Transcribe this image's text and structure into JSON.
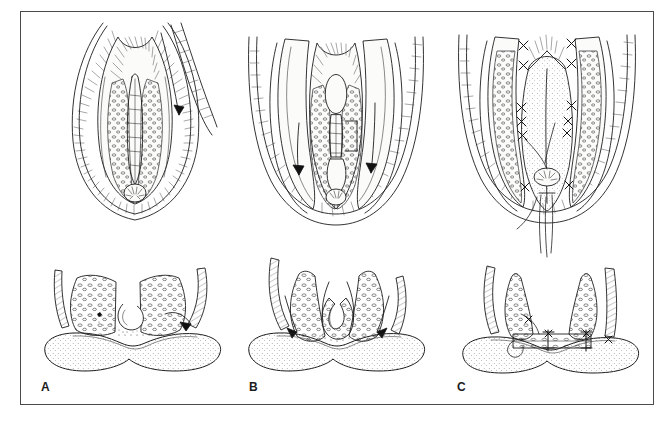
{
  "figure": {
    "kind": "medical-surgical-line-illustration",
    "style": "black-and-white pen-and-ink stipple/hatch line drawing",
    "background_color": "#ffffff",
    "ink_color": "#1d1d1d",
    "frame": {
      "present": true,
      "border_color": "#4a4a4a",
      "border_width_px": 1,
      "x": 20,
      "y": 11,
      "width": 634,
      "height": 394
    },
    "rows": [
      {
        "name": "superior-oral-view",
        "description": "Intraoral view of the palate from below/above showing the cleft, flaps and sutures"
      },
      {
        "name": "coronal-cross-section",
        "description": "Coronal section through the palate showing mucoperiosteal flaps, nasal mucosa and tongue"
      }
    ],
    "panels": [
      {
        "id": "A",
        "label": "A",
        "label_x": 40,
        "label_y": 385,
        "stage": "Markings and incisions — unrepaired cleft exposed",
        "top_view": {
          "description": "Oral view of a wide cleft of the secondary palate with lateral relaxing incision marked; uvula split, stippled palatal mucosa, hatched lip/cheek retraction",
          "features": [
            "cleft-margin",
            "lateral-relaxing-incision",
            "uvula",
            "hatched-mucosa",
            "retractor-edge",
            "incision-arrow"
          ]
        },
        "bottom_view": {
          "description": "Coronal section: two unelevated mucoperiosteal palatal shelves with stippled bone, nasal mucosa hook at the cleft edge, tongue below; arrow indicates incision direction",
          "features": [
            "palatal-shelf-left",
            "palatal-shelf-right",
            "nasal-mucosa-hook",
            "tongue",
            "alveolar-strip-left",
            "alveolar-strip-right",
            "incision-arrow"
          ]
        }
      },
      {
        "id": "B",
        "label": "B",
        "label_x": 248,
        "label_y": 385,
        "stage": "Flap elevation and medial mobilization",
        "top_view": {
          "description": "Oral view after lateral relaxing incisions; bipedicled mucoperiosteal flaps elevated and rotated medially, raw lateral gutters visible, arrows show medial advancement",
          "features": [
            "elevated-flap-left",
            "elevated-flap-right",
            "lateral-relaxing-gutter",
            "cleft-margin",
            "medial-advancement-arrow-left",
            "medial-advancement-arrow-right"
          ]
        },
        "bottom_view": {
          "description": "Coronal section: flaps lifted off bone and swung medially, nasal-mucosa hook dissected free, arrows show rotation toward the midline",
          "features": [
            "mobilized-flap-left",
            "mobilized-flap-right",
            "nasal-mucosa-hook",
            "tongue",
            "rotation-arrow-left",
            "rotation-arrow-right"
          ]
        }
      },
      {
        "id": "C",
        "label": "C",
        "label_x": 450,
        "label_y": 385,
        "stage": "Midline closure with interrupted sutures",
        "top_view": {
          "description": "Oral view of the completed two-layer repair: midline suture line from the hard palate to the uvula, interrupted X-stitches along the closure and lateral gutters, long suture tails hanging from the uvula",
          "features": [
            "midline-suture-line",
            "interrupted-suture",
            "uvula-repair",
            "lateral-gutter",
            "suture-tails"
          ]
        },
        "bottom_view": {
          "description": "Coronal section: flaps apposed in the midline forming an intact palate with sutures across the closure and at the lateral attachments; tongue below",
          "features": [
            "closed-palate-bridge",
            "suture-knot-mid",
            "suture-knot-left",
            "suture-knot-right",
            "tongue",
            "alveolar-strip-left",
            "alveolar-strip-right"
          ]
        }
      }
    ]
  }
}
